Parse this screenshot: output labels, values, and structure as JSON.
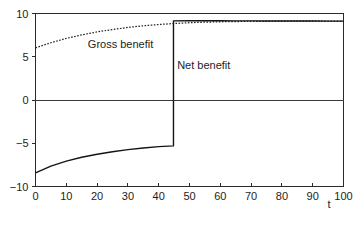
{
  "chart_data": {
    "type": "line",
    "title": "",
    "subtitle": "",
    "xlabel": "t",
    "ylabel": "",
    "xlim": [
      0,
      100
    ],
    "ylim": [
      -10,
      10
    ],
    "grid": false,
    "legend_position": "inline-annotations",
    "x_ticks": [
      0,
      10,
      20,
      30,
      40,
      50,
      60,
      70,
      80,
      90,
      100
    ],
    "x_tick_labels": [
      "0",
      "10",
      "20",
      "30",
      "40",
      "50",
      "60",
      "70",
      "80",
      "90",
      "100"
    ],
    "y_ticks": [
      -10,
      -5,
      0,
      5,
      10
    ],
    "y_tick_labels": [
      "−10",
      "−5",
      "0",
      "5",
      "10"
    ],
    "zero_line": 0,
    "annotations": [
      {
        "text": "Gross benefit",
        "x": 17,
        "y": 6.0,
        "name": "gross-benefit-label"
      },
      {
        "text": "Net benefit",
        "x": 46,
        "y": 3.6,
        "name": "net-benefit-label"
      }
    ],
    "series": [
      {
        "name": "Gross benefit",
        "style": "dotted",
        "color": "#242424",
        "x": [
          0,
          5,
          10,
          15,
          20,
          25,
          30,
          35,
          40,
          44.8,
          50,
          55,
          60,
          65,
          70,
          75,
          80,
          85,
          90,
          95,
          100
        ],
        "values": [
          6.02,
          6.62,
          7.12,
          7.53,
          7.87,
          8.15,
          8.39,
          8.58,
          8.73,
          8.84,
          8.94,
          9.0,
          9.04,
          9.07,
          9.09,
          9.1,
          9.11,
          9.12,
          9.12,
          9.13,
          9.13
        ]
      },
      {
        "name": "Net benefit",
        "style": "solid-with-jump",
        "color": "#141414",
        "jump_x": 44.8,
        "jump_from": -5.3,
        "jump_to": 9.15,
        "x": [
          0,
          5,
          10,
          15,
          20,
          25,
          30,
          35,
          40,
          44.8,
          44.8,
          50,
          55,
          60,
          65,
          70,
          75,
          80,
          85,
          90,
          95,
          100
        ],
        "values": [
          -8.42,
          -7.64,
          -7.07,
          -6.62,
          -6.27,
          -5.98,
          -5.74,
          -5.55,
          -5.39,
          -5.3,
          9.15,
          9.16,
          9.16,
          9.16,
          9.15,
          9.15,
          9.14,
          9.14,
          9.13,
          9.13,
          9.12,
          9.12
        ]
      }
    ]
  }
}
